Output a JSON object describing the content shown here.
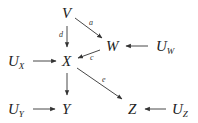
{
  "diagram": {
    "type": "causal-graph",
    "nodes": [
      {
        "id": "V",
        "label": "V",
        "sub": ""
      },
      {
        "id": "W",
        "label": "W",
        "sub": ""
      },
      {
        "id": "X",
        "label": "X",
        "sub": ""
      },
      {
        "id": "Y",
        "label": "Y",
        "sub": ""
      },
      {
        "id": "Z",
        "label": "Z",
        "sub": ""
      },
      {
        "id": "UW",
        "label": "U",
        "sub": "W"
      },
      {
        "id": "UX",
        "label": "U",
        "sub": "X"
      },
      {
        "id": "UY",
        "label": "U",
        "sub": "Y"
      },
      {
        "id": "UZ",
        "label": "U",
        "sub": "Z"
      }
    ],
    "edges": [
      {
        "from": "V",
        "to": "W",
        "label": "a"
      },
      {
        "from": "V",
        "to": "X",
        "label": "d"
      },
      {
        "from": "W",
        "to": "X",
        "label": "c"
      },
      {
        "from": "X",
        "to": "Z",
        "label": "e"
      },
      {
        "from": "X",
        "to": "Y",
        "label": ""
      },
      {
        "from": "UW",
        "to": "W",
        "label": ""
      },
      {
        "from": "UX",
        "to": "X",
        "label": ""
      },
      {
        "from": "UY",
        "to": "Y",
        "label": ""
      },
      {
        "from": "UZ",
        "to": "Z",
        "label": ""
      }
    ]
  }
}
